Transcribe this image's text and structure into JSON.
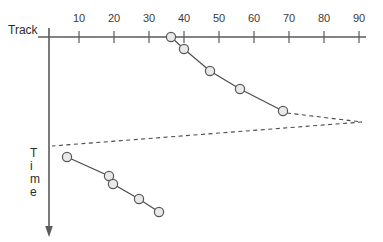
{
  "figure": {
    "background_color": "#ffffff",
    "axes": {
      "horizontal": {
        "title": "Track",
        "title_x": 8,
        "title_y": 34,
        "y": 37,
        "x_start": 38,
        "x_end": 366,
        "tick_values": [
          10,
          20,
          30,
          40,
          50,
          60,
          70,
          80,
          90,
          100
        ],
        "tick_labels": [
          "10",
          "20",
          "30",
          "40",
          "50",
          "60",
          "70",
          "80",
          "90",
          ""
        ],
        "tick_px": [
          79,
          114,
          149,
          184,
          219,
          254,
          289,
          324,
          359
        ],
        "label_y": 22,
        "tick_top": 31,
        "tick_bottom": 43
      },
      "vertical": {
        "title": "Time",
        "title_letters": [
          "T",
          "i",
          "m",
          "e"
        ],
        "title_x": 30,
        "title_y_start": 157,
        "title_line_height": 13,
        "x": 49,
        "y_start": 28,
        "y_end": 229,
        "arrow_y": 236
      }
    },
    "colors": {
      "axis": "#5a5a5a",
      "line": "#4a4a4a",
      "marker_fill": "#e9e9e9",
      "marker_stroke": "#585858",
      "text": "#2b2b2b"
    },
    "marker_radius": 4.6
  },
  "chart_data": {
    "type": "line",
    "title": "",
    "xlabel": "Track",
    "ylabel": "Time",
    "xlim": [
      0,
      100
    ],
    "grid": false,
    "legend": "none",
    "axis_origin_px": [
      44,
      37
    ],
    "px_per_unit_x": 3.5,
    "note": "Disk head movement over time; x = track number, y = time increasing downward",
    "series": [
      {
        "name": "upper-sweep",
        "style": "solid",
        "points_px": [
          [
            171,
            37
          ],
          [
            184,
            49
          ],
          [
            210,
            71
          ],
          [
            240,
            89
          ],
          [
            283,
            111
          ]
        ],
        "track_values": [
          36,
          40,
          47,
          56,
          68
        ],
        "time_index": [
          0,
          1,
          2,
          3,
          4
        ]
      },
      {
        "name": "lower-sweep",
        "style": "solid",
        "points_px": [
          [
            67,
            157
          ],
          [
            109,
            176
          ],
          [
            113,
            184
          ],
          [
            139,
            199
          ],
          [
            159,
            212
          ]
        ],
        "track_values": [
          7,
          19,
          20,
          27,
          33
        ],
        "time_index": [
          5,
          6,
          7,
          8,
          9
        ]
      }
    ],
    "dashed_connectors": [
      {
        "name": "upper-return",
        "points_px": [
          [
            287,
            113
          ],
          [
            362,
            122
          ]
        ]
      },
      {
        "name": "lower-return",
        "points_px": [
          [
            362,
            122
          ],
          [
            52,
            146
          ]
        ]
      }
    ]
  }
}
